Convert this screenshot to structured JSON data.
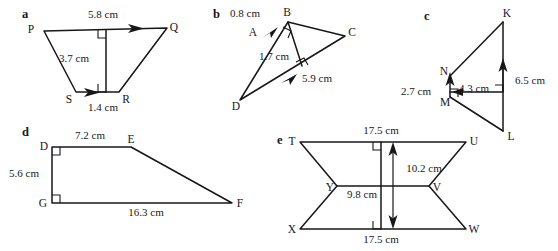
{
  "page": {
    "background_color": "#ffffff",
    "ink_color": "#17171a",
    "width": 558,
    "height": 251
  },
  "figures": [
    {
      "key": "a",
      "part_label": "a",
      "shape": "trapezium PQRS with perpendicular height",
      "vertices": [
        {
          "name": "P",
          "label": "P",
          "x": 36,
          "y": 29
        },
        {
          "name": "Q",
          "label": "Q",
          "x": 167,
          "y": 27
        },
        {
          "name": "R",
          "label": "R",
          "x": 117,
          "y": 93
        },
        {
          "name": "S",
          "label": "S",
          "x": 72,
          "y": 93
        }
      ],
      "dimensions": [
        {
          "name": "top-side",
          "label": "5.8 cm",
          "x": 103,
          "y": 17
        },
        {
          "name": "height",
          "label": "3.7 cm",
          "x": 72,
          "y": 58
        },
        {
          "name": "base-side",
          "label": "1.4 cm",
          "x": 101,
          "y": 110
        }
      ],
      "right_angles": 2,
      "parallel_marks": 2
    },
    {
      "key": "b",
      "part_label": "b",
      "shape": "triangle BCD with point A on BD and perpendicular height",
      "vertices": [
        {
          "name": "B",
          "label": "B",
          "x": 287,
          "y": 17
        },
        {
          "name": "A",
          "label": "A",
          "x": 253,
          "y": 32
        },
        {
          "name": "C",
          "label": "C",
          "x": 348,
          "y": 33
        },
        {
          "name": "D",
          "label": "D",
          "x": 239,
          "y": 103
        }
      ],
      "dimensions": [
        {
          "name": "segment-ab",
          "label": "0.8 cm",
          "x": 245,
          "y": 16
        },
        {
          "name": "height-inner",
          "label": "1.7 cm",
          "x": 273,
          "y": 57
        },
        {
          "name": "base-dc",
          "label": "5.9 cm",
          "x": 314,
          "y": 79
        }
      ],
      "right_angles": 2,
      "parallel_marks": 2
    },
    {
      "key": "c",
      "part_label": "c",
      "shape": "triangle KML with point N and perpendicular widths",
      "vertices": [
        {
          "name": "K",
          "label": "K",
          "x": 505,
          "y": 17
        },
        {
          "name": "N",
          "label": "N",
          "x": 448,
          "y": 71
        },
        {
          "name": "M",
          "label": "M",
          "x": 450,
          "y": 102
        },
        {
          "name": "L",
          "label": "L",
          "x": 509,
          "y": 137
        }
      ],
      "dimensions": [
        {
          "name": "segment-mn",
          "label": "2.7 cm",
          "x": 416,
          "y": 92
        },
        {
          "name": "width-inner",
          "label": "4.3 cm",
          "x": 466,
          "y": 89
        },
        {
          "name": "height-kl",
          "label": "6.5 cm",
          "x": 515,
          "y": 80
        }
      ],
      "right_angles": 2,
      "parallel_marks": 3
    },
    {
      "key": "d",
      "part_label": "d",
      "shape": "right trapezium DEFG",
      "vertices": [
        {
          "name": "D",
          "label": "D",
          "x": 47,
          "y": 146
        },
        {
          "name": "E",
          "label": "E",
          "x": 130,
          "y": 146
        },
        {
          "name": "F",
          "label": "F",
          "x": 232,
          "y": 204
        },
        {
          "name": "G",
          "label": "G",
          "x": 47,
          "y": 204
        }
      ],
      "dimensions": [
        {
          "name": "top-side-de",
          "label": "7.2 cm",
          "x": 88,
          "y": 136
        },
        {
          "name": "left-side-dg",
          "label": "5.6 cm",
          "x": 24,
          "y": 176
        },
        {
          "name": "base-gf",
          "label": "16.3 cm",
          "x": 144,
          "y": 214
        }
      ],
      "right_angles": 2,
      "parallel_marks": 0
    },
    {
      "key": "e",
      "part_label": "e",
      "shape": "bow-tie hexagon TUVWXY with perpendicular height",
      "vertices": [
        {
          "name": "T",
          "label": "T",
          "x": 296,
          "y": 141
        },
        {
          "name": "U",
          "label": "U",
          "x": 468,
          "y": 141
        },
        {
          "name": "V",
          "label": "V",
          "x": 430,
          "y": 185
        },
        {
          "name": "W",
          "label": "W",
          "x": 468,
          "y": 230
        },
        {
          "name": "X",
          "label": "X",
          "x": 296,
          "y": 230
        },
        {
          "name": "Y",
          "label": "Y",
          "x": 335,
          "y": 185
        }
      ],
      "dimensions": [
        {
          "name": "top-side-tu",
          "label": "17.5 cm",
          "x": 380,
          "y": 131
        },
        {
          "name": "height",
          "label": "10.2 cm",
          "x": 412,
          "y": 168
        },
        {
          "name": "middle-yv",
          "label": "9.8 cm",
          "x": 358,
          "y": 195
        },
        {
          "name": "base-xw",
          "label": "17.5 cm",
          "x": 380,
          "y": 241
        }
      ],
      "right_angles": 2,
      "parallel_marks": 0
    }
  ]
}
